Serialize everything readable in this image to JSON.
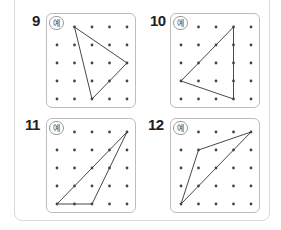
{
  "problems": [
    {
      "number": "9",
      "badge": "예",
      "box": {
        "left": 46,
        "top": 13
      },
      "vertices": [
        [
          1,
          0
        ],
        [
          4,
          2
        ],
        [
          2,
          4
        ]
      ]
    },
    {
      "number": "10",
      "badge": "예",
      "box": {
        "left": 170,
        "top": 13
      },
      "vertices": [
        [
          3,
          0
        ],
        [
          0,
          3
        ],
        [
          3,
          4
        ]
      ]
    },
    {
      "number": "11",
      "badge": "예",
      "box": {
        "left": 46,
        "top": 118
      },
      "vertices": [
        [
          4,
          0
        ],
        [
          0,
          4
        ],
        [
          2,
          4
        ]
      ]
    },
    {
      "number": "12",
      "badge": "예",
      "box": {
        "left": 170,
        "top": 118
      },
      "vertices": [
        [
          4,
          0
        ],
        [
          1,
          1
        ],
        [
          0,
          4
        ]
      ]
    }
  ],
  "grid": {
    "cols": 5,
    "rows": 5,
    "dot_color": "#444444",
    "line_color": "#333333"
  }
}
